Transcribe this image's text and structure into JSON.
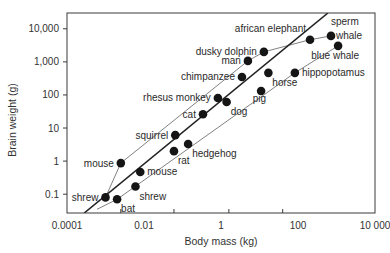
{
  "chart_data": {
    "type": "scatter",
    "title": "",
    "xlabel": "Body mass (kg)",
    "ylabel": "Brain weight (g)",
    "x_scale": "log",
    "y_scale": "log",
    "xlim": [
      0.0001,
      10000
    ],
    "ylim": [
      0.027,
      30000
    ],
    "grid": false,
    "legend": "none",
    "x_tick_labels": [
      "0.0001",
      "0.01",
      "1",
      "100",
      "10 000"
    ],
    "x_tick_values": [
      0.0001,
      0.01,
      1,
      100,
      10000
    ],
    "x_minor_tick_values": [
      0.0025,
      0.06,
      1.6,
      40
    ],
    "y_tick_labels": [
      "0.1",
      "1",
      "10",
      "100",
      "1,000",
      "10,000"
    ],
    "y_tick_values": [
      0.1,
      1,
      10,
      100,
      1000,
      10000
    ],
    "points": [
      {
        "label": "shrew",
        "x": 0.001,
        "y": 0.08,
        "label_pos": "left"
      },
      {
        "label": "bat",
        "x": 0.002,
        "y": 0.07,
        "label_pos": "below-right"
      },
      {
        "label": "shrew",
        "x": 0.006,
        "y": 0.17,
        "label_pos": "below-right"
      },
      {
        "label": "mouse",
        "x": 0.008,
        "y": 0.47,
        "label_pos": "right"
      },
      {
        "label": "mouse",
        "x": 0.0025,
        "y": 0.87,
        "label_pos": "left"
      },
      {
        "label": "rat",
        "x": 0.06,
        "y": 2.0,
        "label_pos": "below-right"
      },
      {
        "label": "hedgehog",
        "x": 0.14,
        "y": 3.3,
        "label_pos": "below-right"
      },
      {
        "label": "squirrel",
        "x": 0.065,
        "y": 6.1,
        "label_pos": "left"
      },
      {
        "label": "cat",
        "x": 0.34,
        "y": 26,
        "label_pos": "left"
      },
      {
        "label": "rhesus monkey",
        "x": 0.83,
        "y": 81,
        "label_pos": "left"
      },
      {
        "label": "dog",
        "x": 1.4,
        "y": 61,
        "label_pos": "below-right"
      },
      {
        "label": "pig",
        "x": 11,
        "y": 132,
        "label_pos": "below-left"
      },
      {
        "label": "chimpanzee",
        "x": 3.5,
        "y": 350,
        "label_pos": "left"
      },
      {
        "label": "horse",
        "x": 17,
        "y": 466,
        "label_pos": "below-right"
      },
      {
        "label": "hippopotamus",
        "x": 83,
        "y": 466,
        "label_pos": "right"
      },
      {
        "label": "man",
        "x": 5,
        "y": 1070,
        "label_pos": "left"
      },
      {
        "label": "dusky dolphin",
        "x": 13,
        "y": 2000,
        "label_pos": "left"
      },
      {
        "label": "african elephant",
        "x": 205,
        "y": 4670,
        "label_pos": "above-left"
      },
      {
        "label": "sperm whale",
        "x": 720,
        "y": 6100,
        "label_pos": "above-right"
      },
      {
        "label": "blue whale",
        "x": 1100,
        "y": 3050,
        "label_pos": "below-left"
      }
    ],
    "regression_line": {
      "x": [
        0.00028,
        600
      ],
      "y": [
        0.027,
        30000
      ]
    },
    "upper_envelope": {
      "points": [
        [
          0.001,
          0.08
        ],
        [
          0.0025,
          0.87
        ],
        [
          5,
          1070
        ],
        [
          13,
          2000
        ],
        [
          205,
          4670
        ],
        [
          720,
          6100
        ]
      ]
    },
    "lower_envelope": {
      "points": [
        [
          0.0006,
          0.035
        ],
        [
          0.002,
          0.07
        ],
        [
          83,
          466
        ],
        [
          1100,
          3050
        ]
      ]
    }
  },
  "layout": {
    "plot_left": 67,
    "plot_right": 375,
    "plot_top": 13,
    "plot_bottom": 213
  }
}
